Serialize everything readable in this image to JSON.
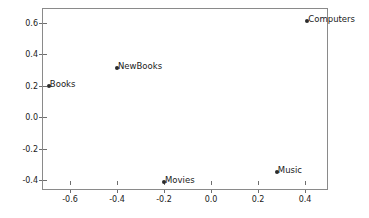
{
  "chart_data": {
    "type": "scatter",
    "title": "",
    "xlabel": "",
    "ylabel": "",
    "xlim": [
      -0.72,
      0.5
    ],
    "ylim": [
      -0.46,
      0.69
    ],
    "grid": false,
    "legend": null,
    "xticks": [
      "-0.6",
      "-0.4",
      "-0.2",
      "0.0",
      "0.2",
      "0.4"
    ],
    "xtick_values": [
      -0.6,
      -0.4,
      -0.2,
      0.0,
      0.2,
      0.4
    ],
    "yticks": [
      "0.6",
      "0.4",
      "0.2",
      "0.0",
      "-0.2",
      "-0.4"
    ],
    "ytick_values": [
      0.6,
      0.4,
      0.2,
      0.0,
      -0.2,
      -0.4
    ],
    "marker_color": "#2b2b2b",
    "axis_color": "#8a8a8a",
    "points": [
      {
        "label": "Books",
        "x": -0.69,
        "y": 0.2
      },
      {
        "label": "NewBooks",
        "x": -0.4,
        "y": 0.31
      },
      {
        "label": "Computers",
        "x": 0.41,
        "y": 0.61
      },
      {
        "label": "Music",
        "x": 0.28,
        "y": -0.35
      },
      {
        "label": "Movies",
        "x": -0.2,
        "y": -0.41
      }
    ]
  }
}
